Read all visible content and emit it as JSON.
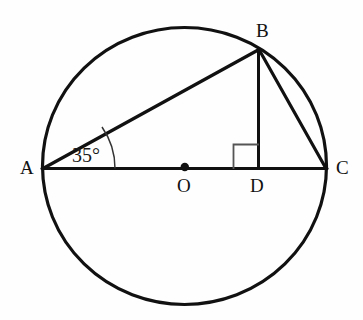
{
  "figure": {
    "background_color": "#fefefe",
    "stroke_color": "#111111",
    "labels": {
      "point_a": "A",
      "point_b": "B",
      "point_c": "C",
      "point_o": "O",
      "point_d": "D",
      "angle_at_a": "35°"
    },
    "geometry": {
      "circle": {
        "center_x": 184.5,
        "center_y": 166,
        "radius_x": 142,
        "radius_y": 138.5,
        "stroke_width": 3.2
      },
      "points": {
        "A": {
          "x": 43,
          "y": 168.5
        },
        "B": {
          "x": 259,
          "y": 49
        },
        "C": {
          "x": 326,
          "y": 168.5
        },
        "O": {
          "x": 184.5,
          "y": 167
        },
        "D": {
          "x": 258.5,
          "y": 168.5
        }
      },
      "segments": [
        {
          "name": "diameter-ac",
          "from": "A",
          "to": "C"
        },
        {
          "name": "chord-ab",
          "from": "A",
          "to": "B"
        },
        {
          "name": "chord-bc",
          "from": "B",
          "to": "C"
        },
        {
          "name": "altitude-bd",
          "from": "B",
          "to": "D"
        }
      ],
      "center_dot_radius": 4.2,
      "angle_arc": {
        "at": "A",
        "radius": 72,
        "start_x": 115,
        "start_y": 168.5,
        "end_x": 102.5,
        "end_y": 127.5
      },
      "right_angle_marker": {
        "at": "D",
        "size": 25,
        "orientation": "upper-left"
      }
    }
  }
}
